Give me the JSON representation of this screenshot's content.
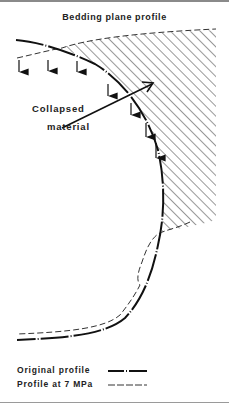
{
  "title": "Bedding plane profile",
  "annotation": {
    "line1": "Collapsed",
    "line2": "material"
  },
  "legend": [
    {
      "label": "Original profile",
      "line_style": "dash-dot-solid-thick"
    },
    {
      "label": "Profile at 7 MPa",
      "line_style": "dashed-thin"
    }
  ],
  "colors": {
    "ink": "#222222",
    "background": "#ffffff"
  }
}
